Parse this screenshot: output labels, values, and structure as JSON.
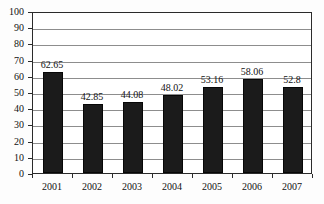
{
  "chart_data": {
    "type": "bar",
    "title": "",
    "subtitle": "",
    "xlabel": "",
    "ylabel": "",
    "categories": [
      "2001",
      "2002",
      "2003",
      "2004",
      "2005",
      "2006",
      "2007"
    ],
    "values": [
      62.65,
      42.85,
      44.08,
      48.02,
      53.16,
      58.06,
      52.8
    ],
    "value_labels": [
      "62.65",
      "42.85",
      "44.08",
      "48.02",
      "53.16",
      "58.06",
      "52.8"
    ],
    "ylim": [
      0,
      100
    ],
    "ytick_labels": [
      "0",
      "10",
      "20",
      "30",
      "40",
      "50",
      "60",
      "70",
      "80",
      "90",
      "100"
    ],
    "ytick_values": [
      0,
      10,
      20,
      30,
      40,
      50,
      60,
      70,
      80,
      90,
      100
    ],
    "grid": true,
    "grid_axis": "y",
    "legend": false,
    "legend_position": "none",
    "series": [
      {
        "name": "",
        "values": [
          62.65,
          42.85,
          44.08,
          48.02,
          53.16,
          58.06,
          52.8
        ],
        "color": "#1b1b1b"
      }
    ]
  },
  "style": {
    "bar_color": "#1b1b1b",
    "grid_color": "#8d8d8d",
    "frame_color": "#2b2b2b",
    "background": "#fdfdfd",
    "plot_background": "#ffffff",
    "text_color": "#131313"
  }
}
